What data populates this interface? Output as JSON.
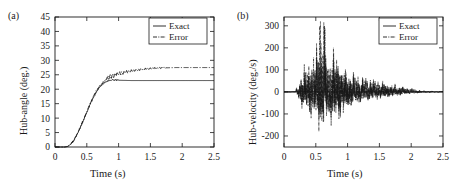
{
  "figure": {
    "background": "#ffffff",
    "foreground": "#1a1a1a",
    "panel_count": 2
  },
  "panel_a": {
    "tag": "(a)",
    "legend": {
      "position": "top-right",
      "entries": [
        {
          "label": "Exact",
          "style": "solid"
        },
        {
          "label": "Error",
          "style": "dash-dot"
        }
      ]
    },
    "chart_data": {
      "type": "line",
      "title": "",
      "xlabel": "Time (s)",
      "ylabel": "Hub-angle (deg.)",
      "xlim": [
        0,
        2.5
      ],
      "ylim": [
        0,
        45
      ],
      "xticks": [
        "0",
        "0.5",
        "1",
        "1.5",
        "2",
        "2.5"
      ],
      "xtick_values": [
        0,
        0.5,
        1,
        1.5,
        2,
        2.5
      ],
      "yticks": [
        "0",
        "5",
        "10",
        "15",
        "20",
        "25",
        "30",
        "35",
        "40",
        "45"
      ],
      "ytick_values": [
        0,
        5,
        10,
        15,
        20,
        25,
        30,
        35,
        40,
        45
      ],
      "grid": false,
      "legend_position": "upper right",
      "series": [
        {
          "name": "Exact",
          "style": "solid",
          "color": "#1a1a1a",
          "x": [
            0,
            0.05,
            0.1,
            0.15,
            0.2,
            0.25,
            0.3,
            0.35,
            0.4,
            0.45,
            0.5,
            0.55,
            0.6,
            0.65,
            0.7,
            0.75,
            0.8,
            0.85,
            0.9,
            0.95,
            1.0,
            1.1,
            1.2,
            1.3,
            1.4,
            1.5,
            1.6,
            1.7,
            1.8,
            1.9,
            2.0,
            2.1,
            2.2,
            2.3,
            2.4,
            2.5
          ],
          "values": [
            0,
            0,
            0,
            0,
            0.2,
            1.0,
            2.4,
            4.4,
            6.8,
            9.4,
            12.0,
            14.6,
            17.0,
            19.0,
            20.6,
            21.8,
            22.6,
            23.0,
            23.2,
            23.2,
            23.1,
            23.05,
            23.0,
            23.0,
            23.0,
            23.0,
            23.0,
            23.0,
            23.0,
            23.0,
            23.0,
            23.0,
            23.0,
            23.0,
            23.0,
            23.0
          ]
        },
        {
          "name": "Error",
          "style": "dash-dot",
          "color": "#1a1a1a",
          "x": [
            0,
            0.05,
            0.1,
            0.15,
            0.2,
            0.25,
            0.3,
            0.35,
            0.4,
            0.45,
            0.5,
            0.55,
            0.6,
            0.65,
            0.7,
            0.75,
            0.8,
            0.85,
            0.9,
            0.95,
            1.0,
            1.05,
            1.1,
            1.15,
            1.2,
            1.3,
            1.4,
            1.5,
            1.6,
            1.7,
            1.8,
            1.9,
            2.0,
            2.1,
            2.2,
            2.3,
            2.4,
            2.5
          ],
          "values": [
            0,
            0,
            0,
            0,
            0.2,
            1.1,
            2.5,
            4.5,
            7.0,
            9.6,
            12.2,
            14.9,
            17.3,
            19.4,
            21.0,
            22.3,
            23.4,
            24.3,
            24.6,
            25.0,
            25.4,
            25.6,
            25.9,
            26.1,
            26.3,
            26.7,
            27.0,
            27.2,
            27.3,
            27.4,
            27.45,
            27.5,
            27.5,
            27.5,
            27.5,
            27.5,
            27.5,
            27.5
          ],
          "note": "small-amplitude ripple superimposed between 0.85 s and 1.7 s"
        }
      ]
    }
  },
  "panel_b": {
    "tag": "(b)",
    "legend": {
      "position": "top-right",
      "entries": [
        {
          "label": "Exact",
          "style": "solid"
        },
        {
          "label": "Error",
          "style": "dash-dot"
        }
      ]
    },
    "chart_data": {
      "type": "line",
      "title": "",
      "xlabel": "Time (s)",
      "ylabel": "Hub-velocity (deg./s)",
      "xlim": [
        0,
        2.5
      ],
      "ylim": [
        -250,
        340
      ],
      "xticks": [
        "0",
        "0.5",
        "1",
        "1.5",
        "2",
        "2.5"
      ],
      "xtick_values": [
        0,
        0.5,
        1,
        1.5,
        2,
        2.5
      ],
      "yticks": [
        "-200",
        "-100",
        "0",
        "100",
        "200",
        "300"
      ],
      "ytick_values": [
        -200,
        -100,
        0,
        100,
        200,
        300
      ],
      "grid": false,
      "legend_position": "upper right",
      "series": [
        {
          "name": "Exact",
          "style": "solid",
          "color": "#1a1a1a",
          "description": "near-zero baseline across full record",
          "x": [
            0,
            0.5,
            1.0,
            1.5,
            2.0,
            2.5
          ],
          "values": [
            0,
            0,
            0,
            0,
            0,
            0
          ]
        },
        {
          "name": "Error",
          "style": "dash-dot",
          "color": "#1a1a1a",
          "description": "high-frequency oscillatory burst beginning near 0.2 s, peak amplitude above 300 deg./s near 0.6 s, decaying to near zero by 2.2 s",
          "envelope_x": [
            0.0,
            0.2,
            0.3,
            0.4,
            0.5,
            0.6,
            0.7,
            0.8,
            0.9,
            1.0,
            1.1,
            1.2,
            1.3,
            1.4,
            1.5,
            1.6,
            1.7,
            1.8,
            1.9,
            2.0,
            2.1,
            2.2,
            2.5
          ],
          "envelope_upper": [
            0,
            20,
            120,
            150,
            200,
            330,
            180,
            240,
            150,
            110,
            90,
            75,
            70,
            65,
            58,
            50,
            42,
            34,
            26,
            18,
            10,
            6,
            3
          ],
          "envelope_lower": [
            0,
            -15,
            -90,
            -110,
            -150,
            -200,
            -140,
            -170,
            -120,
            -95,
            -70,
            -55,
            -45,
            -40,
            -35,
            -30,
            -25,
            -20,
            -15,
            -10,
            -7,
            -4,
            -2
          ]
        }
      ]
    }
  }
}
